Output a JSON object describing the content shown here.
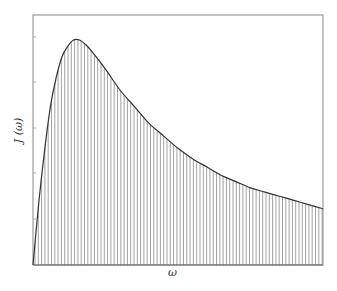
{
  "chart_data": {
    "type": "area",
    "title": "",
    "xlabel": "ω",
    "ylabel": "J (ω)",
    "x_tick_labels": [],
    "y_tick_labels": [],
    "fill_style": "vertical-hatch",
    "grid": false,
    "legend": null,
    "xlim": [
      0,
      1
    ],
    "ylim": [
      0,
      1.2
    ],
    "x": [
      0,
      0.02,
      0.04,
      0.06,
      0.08,
      0.1,
      0.12,
      0.14,
      0.16,
      0.18,
      0.2,
      0.25,
      0.3,
      0.35,
      0.4,
      0.45,
      0.5,
      0.55,
      0.6,
      0.65,
      0.7,
      0.75,
      0.8,
      0.85,
      0.9,
      0.95,
      1.0
    ],
    "values": [
      0,
      0.3,
      0.55,
      0.76,
      0.9,
      1.0,
      1.05,
      1.08,
      1.08,
      1.06,
      1.03,
      0.94,
      0.84,
      0.76,
      0.68,
      0.62,
      0.56,
      0.51,
      0.47,
      0.43,
      0.4,
      0.37,
      0.35,
      0.33,
      0.31,
      0.29,
      0.27
    ],
    "curve_color": "#333333",
    "hatch_color": "#8a8a8a",
    "frame_color": "#888888"
  },
  "labels": {
    "x": "ω",
    "y": "J (ω)"
  }
}
